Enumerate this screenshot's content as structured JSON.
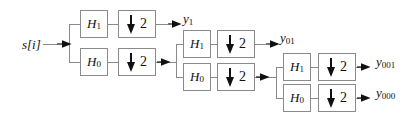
{
  "figure": {
    "type": "block-diagram",
    "background_color": "#ffffff",
    "line_color": "#8a8a8a",
    "arrow_color": "#111111",
    "box_border_color": "#8a8a8a"
  },
  "input": {
    "label": "s[i]",
    "name": "input-signal"
  },
  "downsample": {
    "factor": "2",
    "arrow_icon": "down-arrow-icon"
  },
  "stages": [
    {
      "name": "stage-1",
      "highpass": {
        "base": "H",
        "sub": "1"
      },
      "lowpass": {
        "base": "H",
        "sub": "0"
      },
      "output": {
        "base": "y",
        "sub": "1"
      }
    },
    {
      "name": "stage-2",
      "highpass": {
        "base": "H",
        "sub": "1"
      },
      "lowpass": {
        "base": "H",
        "sub": "0"
      },
      "output": {
        "base": "y",
        "sub": "01"
      }
    },
    {
      "name": "stage-3",
      "highpass": {
        "base": "H",
        "sub": "1"
      },
      "lowpass": {
        "base": "H",
        "sub": "0"
      },
      "output_high": {
        "base": "y",
        "sub": "001"
      },
      "output_low": {
        "base": "y",
        "sub": "000"
      }
    }
  ],
  "blocks": {
    "s1_h1": {
      "base": "H",
      "sub": "1"
    },
    "s1_h0": {
      "base": "H",
      "sub": "0"
    },
    "s2_h1": {
      "base": "H",
      "sub": "1"
    },
    "s2_h0": {
      "base": "H",
      "sub": "0"
    },
    "s3_h1": {
      "base": "H",
      "sub": "1"
    },
    "s3_h0": {
      "base": "H",
      "sub": "0"
    }
  },
  "ds_blocks": {
    "s1_ds_high": "2",
    "s1_ds_low": "2",
    "s2_ds_high": "2",
    "s2_ds_low": "2",
    "s3_ds_high": "2",
    "s3_ds_low": "2"
  },
  "outputs": {
    "y1": {
      "base": "y",
      "sub": "1"
    },
    "y01": {
      "base": "y",
      "sub": "01"
    },
    "y001": {
      "base": "y",
      "sub": "001"
    },
    "y000": {
      "base": "y",
      "sub": "000"
    }
  }
}
